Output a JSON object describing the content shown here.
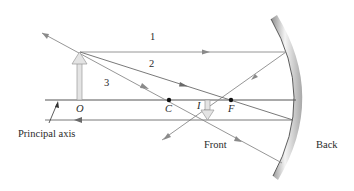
{
  "diagram": {
    "labels": {
      "ray1": "1",
      "ray2": "2",
      "ray3": "3",
      "object": "O",
      "center": "C",
      "image": "I",
      "focus": "F",
      "principal_axis": "Principal axis",
      "front": "Front",
      "back": "Back"
    },
    "colors": {
      "ray": "#8a8a8a",
      "axis": "#555555",
      "mirror_light": "#f2f2f2",
      "mirror_dark": "#9a9a9a",
      "points": "#111111"
    }
  }
}
